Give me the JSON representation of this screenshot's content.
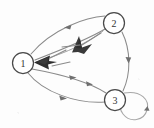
{
  "figure": {
    "title": "",
    "type": "directed-graph",
    "background_color": "#fdfdfd",
    "width": 154,
    "height": 128
  },
  "nodes": [
    {
      "id": "1",
      "label": "1",
      "cx": 23,
      "cy": 63,
      "r": 10.5
    },
    {
      "id": "2",
      "label": "2",
      "cx": 114,
      "cy": 23,
      "r": 10.5
    },
    {
      "id": "3",
      "label": "3",
      "cx": 115,
      "cy": 100,
      "r": 10.5
    }
  ],
  "edges": [
    {
      "id": "e21-upper",
      "from": "2",
      "to": "1",
      "style": "curved-arc",
      "direction": "leftward",
      "arrow_at": "mid"
    },
    {
      "id": "e21-lower",
      "from": "2",
      "to": "1",
      "style": "curved-arc",
      "direction": "leftward",
      "arrow_at": "mid"
    },
    {
      "id": "e23",
      "from": "2",
      "to": "3",
      "style": "curved-arc",
      "direction": "downward",
      "arrow_at": "mid"
    },
    {
      "id": "e13-upper",
      "from": "1",
      "to": "3",
      "style": "curved-arc",
      "direction": "rightward",
      "arrow_at": "mid"
    },
    {
      "id": "e13-lower",
      "from": "1",
      "to": "3",
      "style": "curved-arc",
      "direction": "rightward",
      "arrow_at": "mid"
    },
    {
      "id": "e33-loop",
      "from": "3",
      "to": "3",
      "style": "self-loop",
      "direction": "clockwise",
      "arrow_at": "right"
    }
  ],
  "colors": {
    "edge": "#8a8a8a",
    "edge_faint": "#a2a2a2",
    "arrow": "#6f6f6f",
    "arrow_dark": "#2e2e2e",
    "node_stroke": "#4a4a4a",
    "node_fill": "#ffffff",
    "label": "#333333",
    "background": "#fdfdfd"
  }
}
